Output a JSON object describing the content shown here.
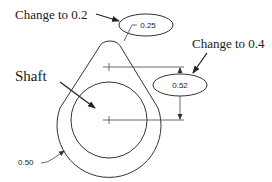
{
  "diagram": {
    "annotations": {
      "top_callout": "Change to 0.2",
      "right_callout": "Change to 0.4",
      "part_label": "Shaft"
    },
    "dimensions": {
      "top_radius": "0.25",
      "center_distance": "0.52",
      "outer_radius": "0.50"
    },
    "colors": {
      "line": "#333333",
      "text": "#1a1a1a",
      "background": "#ffffff"
    }
  }
}
